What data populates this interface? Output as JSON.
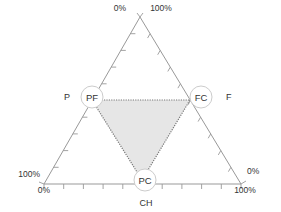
{
  "diagram": {
    "type": "ternary",
    "colors": {
      "frame": "#999999",
      "region_fill": "#e6e6e6",
      "region_stroke": "#777777",
      "node_stroke": "#cccccc",
      "text": "#333333"
    },
    "axes": {
      "left": {
        "label": "P",
        "start": "100%",
        "end": "0%"
      },
      "right": {
        "label": "F",
        "start": "100%",
        "end": "0%"
      },
      "bottom": {
        "label": "CH",
        "start": "0%",
        "end": "100%"
      }
    },
    "vertex_labels": {
      "top_left": "0%",
      "top_right": "100%",
      "left_top": "100%",
      "left_bottom": "0%",
      "right_top": "0%",
      "right_bottom": "100%"
    },
    "nodes": [
      {
        "id": "PF",
        "label": "PF",
        "position": "left-edge-midpoint"
      },
      {
        "id": "FC",
        "label": "FC",
        "position": "right-edge-midpoint"
      },
      {
        "id": "PC",
        "label": "PC",
        "position": "bottom-edge-midpoint"
      }
    ],
    "region": {
      "vertices": [
        "PF",
        "FC",
        "PC"
      ],
      "style": "dotted-outline-shaded"
    },
    "tick_divisions": 10
  }
}
